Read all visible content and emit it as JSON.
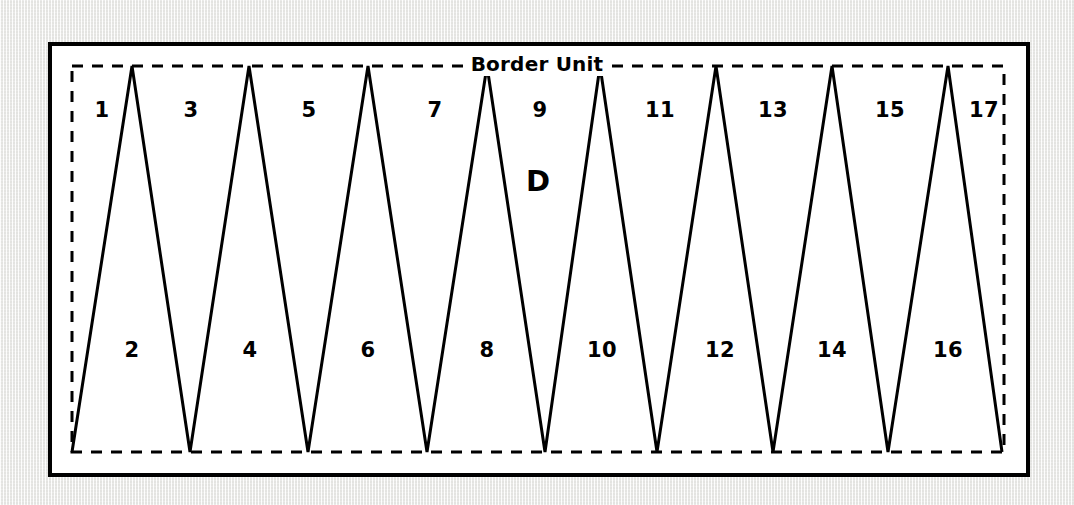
{
  "figure": {
    "title": "Border Unit",
    "region_label": "D",
    "colors": {
      "line": "#000000",
      "frame": "#000000",
      "background": "#ffffff",
      "page": "#f1f1ef"
    },
    "frame": {
      "solid_rect": {
        "x": 48,
        "y": 42,
        "width": 982,
        "height": 435,
        "stroke_width": 4
      },
      "dashed_rect": {
        "x": 72,
        "y": 66,
        "width": 932,
        "height": 386,
        "stroke_width": 3,
        "dash": "11 9"
      }
    },
    "zigzag": {
      "description": "continuous triangular saw-tooth line spanning the dashed border unit",
      "stroke_width": 3,
      "top_y": 66,
      "bottom_y": 452,
      "peaks_x": [
        132,
        249,
        368,
        487,
        600,
        716,
        832,
        948
      ],
      "valleys_x": [
        72,
        190,
        308,
        427,
        545,
        657,
        773,
        888,
        1002
      ]
    },
    "labels_top": [
      {
        "text": "1",
        "x": 102,
        "y": 110
      },
      {
        "text": "3",
        "x": 191,
        "y": 110
      },
      {
        "text": "5",
        "x": 309,
        "y": 110
      },
      {
        "text": "7",
        "x": 435,
        "y": 110
      },
      {
        "text": "9",
        "x": 540,
        "y": 110
      },
      {
        "text": "11",
        "x": 660,
        "y": 110
      },
      {
        "text": "13",
        "x": 773,
        "y": 110
      },
      {
        "text": "15",
        "x": 890,
        "y": 110
      },
      {
        "text": "17",
        "x": 984,
        "y": 110
      }
    ],
    "labels_bottom": [
      {
        "text": "2",
        "x": 132,
        "y": 350
      },
      {
        "text": "4",
        "x": 250,
        "y": 350
      },
      {
        "text": "6",
        "x": 368,
        "y": 350
      },
      {
        "text": "8",
        "x": 487,
        "y": 350
      },
      {
        "text": "10",
        "x": 602,
        "y": 350
      },
      {
        "text": "12",
        "x": 720,
        "y": 350
      },
      {
        "text": "14",
        "x": 832,
        "y": 350
      },
      {
        "text": "16",
        "x": 948,
        "y": 350
      }
    ]
  }
}
